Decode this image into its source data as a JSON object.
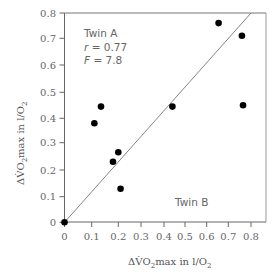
{
  "chart_data": {
    "type": "scatter",
    "title": "",
    "xlabel": "ΔV̇O2max in l/O2",
    "ylabel": "ΔV̇O2max in l/O2",
    "xlim": [
      0,
      0.8
    ],
    "ylim": [
      0,
      0.8
    ],
    "x_ticks": [
      "0",
      "0.1",
      "0.2",
      "0.3",
      "0.4",
      "0.5",
      "0.6",
      "0.7",
      "0.8"
    ],
    "y_ticks": [
      "0",
      "0.1",
      "0.2",
      "0.3",
      "0.4",
      "0.5",
      "0.6",
      "0.7",
      "0.8"
    ],
    "grid": false,
    "series": [
      {
        "name": "Twin pairs",
        "points": [
          {
            "x": 0.0,
            "y": 0.0
          },
          {
            "x": 0.11,
            "y": 0.38
          },
          {
            "x": 0.135,
            "y": 0.445
          },
          {
            "x": 0.18,
            "y": 0.23
          },
          {
            "x": 0.2,
            "y": 0.265
          },
          {
            "x": 0.21,
            "y": 0.13
          },
          {
            "x": 0.44,
            "y": 0.445
          },
          {
            "x": 0.655,
            "y": 0.76
          },
          {
            "x": 0.76,
            "y": 0.71
          },
          {
            "x": 0.765,
            "y": 0.45
          }
        ]
      }
    ],
    "fit_line": {
      "x": [
        0,
        0.8
      ],
      "y": [
        0,
        0.8
      ]
    },
    "annotations": {
      "top_left": [
        "Twin A",
        "r = 0.77",
        "F = 7.8"
      ],
      "bottom_right": "Twin B"
    }
  },
  "labels": {
    "annotation_line1": "Twin A",
    "annotation_r_var": "r",
    "annotation_r_val": " = 0.77",
    "annotation_f_var": "F",
    "annotation_f_val": " = 7.8",
    "twin_b": "Twin B",
    "x_title_prefix": "ΔV̇O",
    "x_title_sub": "2",
    "x_title_suffix": "max in l/O",
    "x_title_sub2": "2",
    "y_title_prefix": "ΔV̇O",
    "y_title_sub": "2",
    "y_title_suffix": "max in l/O",
    "y_title_sub2": "2"
  }
}
